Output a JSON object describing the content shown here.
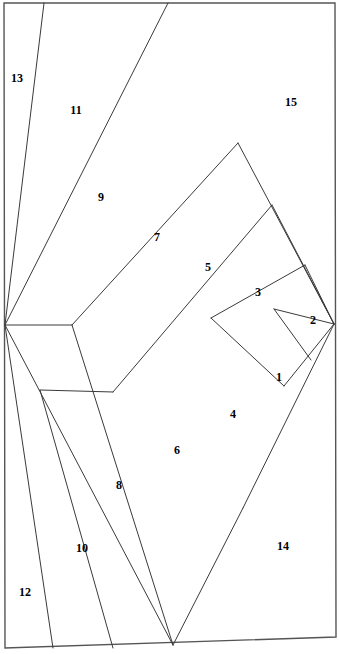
{
  "figure": {
    "width": 339,
    "height": 654,
    "stroke_color": "#3a3a3a",
    "border_color": "#555555",
    "background_color": "#ffffff",
    "stroke_width": 1,
    "border_width": 1.4
  },
  "border": {
    "name": "outer-quadrilateral",
    "points": [
      {
        "x": 4,
        "y": 3
      },
      {
        "x": 335,
        "y": 3
      },
      {
        "x": 336,
        "y": 637
      },
      {
        "x": 5,
        "y": 648
      }
    ]
  },
  "vertices": {
    "fan_origin": {
      "x": 5,
      "y": 325
    },
    "top_apex": {
      "x": 168,
      "y": 3
    },
    "bottom_apex": {
      "x": 173,
      "y": 645
    },
    "right_point": {
      "x": 334,
      "y": 324
    }
  },
  "chevrons": [
    {
      "name": "chevron-outer",
      "top_apex": {
        "x": 168,
        "y": 3
      },
      "left_end": {
        "x": 5,
        "y": 325
      },
      "bottom_apex": {
        "x": 173,
        "y": 645
      }
    },
    {
      "name": "chevron-2",
      "top_apex": {
        "x": 238,
        "y": 143
      },
      "left_vertex": {
        "x": 72,
        "y": 325
      },
      "bottom_apex": {
        "x": 243,
        "y": 508
      },
      "left_end_bottom": {
        "x": 53,
        "y": 648
      }
    },
    {
      "name": "chevron-3",
      "top_apex": {
        "x": 272,
        "y": 205
      },
      "left_vertex": {
        "x": 113,
        "y": 392
      },
      "bottom_apex": {
        "x": 243,
        "y": 508
      }
    },
    {
      "name": "chevron-4",
      "top_apex": {
        "x": 305,
        "y": 265
      },
      "left_vertex": {
        "x": 211,
        "y": 318
      },
      "bottom_apex": {
        "x": 284,
        "y": 386
      }
    },
    {
      "name": "chevron-5",
      "top_apex": {
        "x": 334,
        "y": 324
      },
      "left_vertex": {
        "x": 274,
        "y": 309
      },
      "bottom_apex": {
        "x": 334,
        "y": 324
      }
    }
  ],
  "regions": [
    {
      "id": 1,
      "label": "1",
      "x": 279,
      "y": 377,
      "name": "region-1"
    },
    {
      "id": 2,
      "label": "2",
      "x": 313,
      "y": 320,
      "name": "region-2"
    },
    {
      "id": 3,
      "label": "3",
      "x": 258,
      "y": 292,
      "name": "region-3"
    },
    {
      "id": 4,
      "label": "4",
      "x": 233,
      "y": 414,
      "name": "region-4"
    },
    {
      "id": 5,
      "label": "5",
      "x": 208,
      "y": 267,
      "name": "region-5"
    },
    {
      "id": 6,
      "label": "6",
      "x": 177,
      "y": 450,
      "name": "region-6"
    },
    {
      "id": 7,
      "label": "7",
      "x": 157,
      "y": 237,
      "name": "region-7"
    },
    {
      "id": 8,
      "label": "8",
      "x": 119,
      "y": 485,
      "name": "region-8"
    },
    {
      "id": 9,
      "label": "9",
      "x": 101,
      "y": 197,
      "name": "region-9"
    },
    {
      "id": 10,
      "label": "10",
      "x": 82,
      "y": 548,
      "name": "region-10"
    },
    {
      "id": 11,
      "label": "11",
      "x": 76,
      "y": 110,
      "name": "region-11"
    },
    {
      "id": 12,
      "label": "12",
      "x": 25,
      "y": 592,
      "name": "region-12"
    },
    {
      "id": 13,
      "label": "13",
      "x": 17,
      "y": 78,
      "name": "region-13"
    },
    {
      "id": 14,
      "label": "14",
      "x": 283,
      "y": 546,
      "name": "region-14"
    },
    {
      "id": 15,
      "label": "15",
      "x": 291,
      "y": 102,
      "name": "region-15"
    }
  ],
  "lines": [
    {
      "name": "line-13-11-divider",
      "x1": 44,
      "y1": 3,
      "x2": 5,
      "y2": 325
    },
    {
      "name": "line-12-10-divider",
      "x1": 5,
      "y1": 325,
      "x2": 53,
      "y2": 648
    },
    {
      "name": "line-outer-up",
      "x1": 5,
      "y1": 325,
      "x2": 168,
      "y2": 3
    },
    {
      "name": "line-outer-down",
      "x1": 5,
      "y1": 325,
      "x2": 173,
      "y2": 645
    },
    {
      "name": "line-c2-up-left",
      "x1": 72,
      "y1": 325,
      "x2": 238,
      "y2": 143
    },
    {
      "name": "line-c2-up-right",
      "x1": 238,
      "y1": 143,
      "x2": 334,
      "y2": 324
    },
    {
      "name": "line-c2-lo-left",
      "x1": 72,
      "y1": 325,
      "x2": 5,
      "y2": 325
    },
    {
      "name": "line-c3-up-left",
      "x1": 113,
      "y1": 392,
      "x2": 272,
      "y2": 205
    },
    {
      "name": "line-c3-up-right",
      "x1": 272,
      "y1": 205,
      "x2": 334,
      "y2": 324
    },
    {
      "name": "line-c4-up-left",
      "x1": 211,
      "y1": 318,
      "x2": 305,
      "y2": 265
    },
    {
      "name": "line-c5-up-left",
      "x1": 274,
      "y1": 309,
      "x2": 334,
      "y2": 324
    }
  ]
}
